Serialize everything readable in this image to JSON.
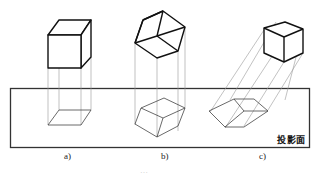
{
  "figure": {
    "plane_label": "投影面",
    "panels": [
      {
        "id": "a",
        "label": "a)",
        "description": "cube with face parallel to projection plane, orthographic projection"
      },
      {
        "id": "b",
        "label": "b)",
        "description": "tilted cube, orthographic projection"
      },
      {
        "id": "c",
        "label": "c)",
        "description": "cube, oblique projection"
      }
    ],
    "caption": "…"
  },
  "colors": {
    "line": "#222222",
    "projector": "#888888",
    "plane": "#333333"
  }
}
